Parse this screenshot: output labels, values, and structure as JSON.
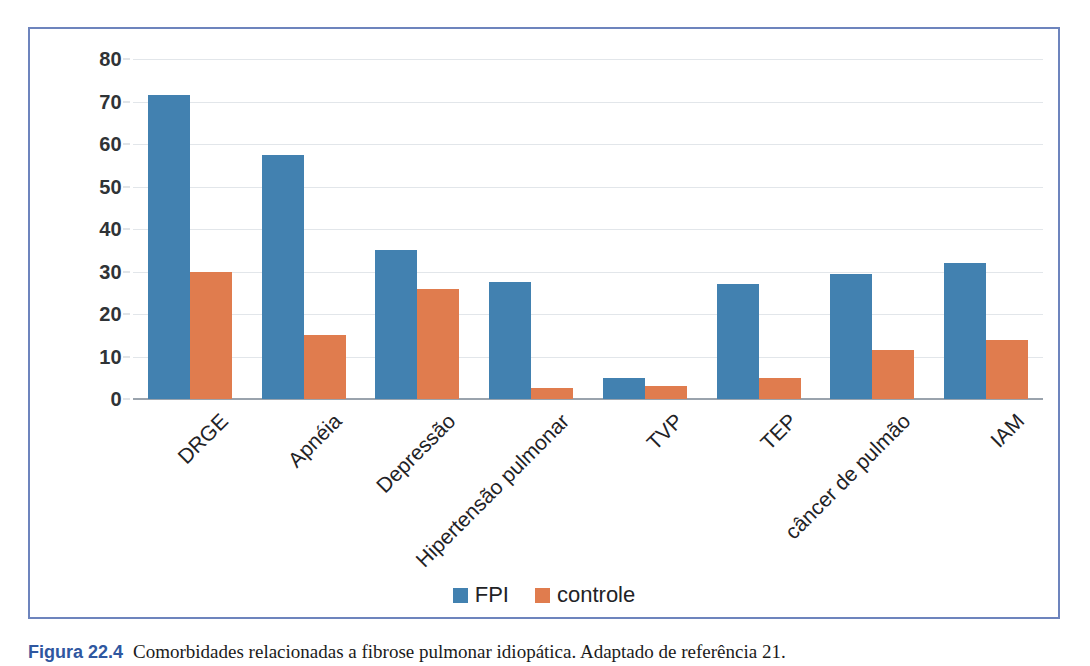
{
  "chart_data": {
    "type": "bar",
    "title": "",
    "subtitle": "",
    "xlabel": "",
    "ylabel": "",
    "ylim": [
      0,
      80
    ],
    "yticks": [
      0,
      10,
      20,
      30,
      40,
      50,
      60,
      70,
      80
    ],
    "ytick_labels": [
      "0",
      "10",
      "20",
      "30",
      "40",
      "50",
      "60",
      "70",
      "80"
    ],
    "grid": true,
    "legend_position": "bottom",
    "categories": [
      "DRGE",
      "Apnéia",
      "Depressão",
      "Hipertensão pulmonar",
      "TVP",
      "TEP",
      "câncer de pulmão",
      "IAM"
    ],
    "series": [
      {
        "name": "FPI",
        "color": "#4281b0",
        "values": [
          71.5,
          57.5,
          35,
          27.5,
          5,
          27,
          29.5,
          32
        ]
      },
      {
        "name": "controle",
        "color": "#e07c4e",
        "values": [
          30,
          15,
          26,
          2.5,
          3,
          5,
          11.5,
          14
        ]
      }
    ]
  },
  "legend": {
    "entries": [
      {
        "label": "FPI",
        "color": "#4281b0"
      },
      {
        "label": "controle",
        "color": "#e07c4e"
      }
    ]
  },
  "caption": {
    "number": "Figura 22.4",
    "text": "Comorbidades relacionadas a fibrose pulmonar idiopática. Adaptado de referência 21."
  },
  "colors": {
    "frame_border": "#6d84bd",
    "gridline": "#e2e6ea",
    "baseline": "#9aa3ad",
    "series_fpi": "#4281b0",
    "series_controle": "#e07c4e",
    "text": "#1f2326"
  }
}
